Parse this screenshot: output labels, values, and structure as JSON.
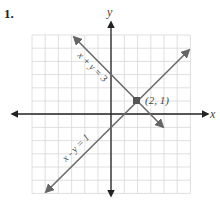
{
  "problem_number": "1.",
  "colors": {
    "grid": "#d8d8d8",
    "axis": "#222222",
    "line": "#6b6b6b",
    "point": "#555555"
  },
  "chart_data": {
    "type": "line",
    "title": "",
    "xlabel": "x",
    "ylabel": "y",
    "xlim": [
      -6,
      6
    ],
    "ylim": [
      -6,
      6
    ],
    "grid": true,
    "series": [
      {
        "name": "x + y = 3",
        "equation": "y = 3 - x",
        "points": [
          [
            -2,
            5
          ],
          [
            5,
            -2
          ]
        ]
      },
      {
        "name": "x - y = 1",
        "equation": "y = x - 1",
        "points": [
          [
            -5,
            -6
          ],
          [
            5,
            4
          ]
        ]
      }
    ],
    "annotations": [
      {
        "text": "(2, 1)",
        "x": 2,
        "y": 1
      }
    ]
  }
}
